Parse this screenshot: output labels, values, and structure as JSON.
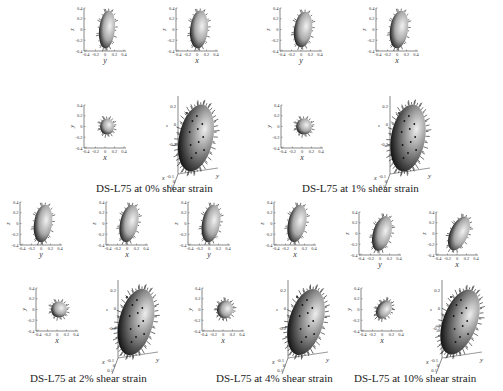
{
  "figure": {
    "groups": [
      {
        "caption": "DS-L75 at 0% shear strain",
        "strain": "0%"
      },
      {
        "caption": "DS-L75 at 1% shear strain",
        "strain": "1%"
      },
      {
        "caption": "DS-L75 at 2% shear strain",
        "strain": "2%"
      },
      {
        "caption": "DS-L75 at 4% shear strain",
        "strain": "4%"
      },
      {
        "caption": "DS-L75 at 10% shear strain",
        "strain": "10%"
      }
    ],
    "subplot_types": [
      {
        "view": "z-vs-y",
        "xlabel": "y",
        "ylabel": "z"
      },
      {
        "view": "z-vs-x",
        "xlabel": "x",
        "ylabel": "z"
      },
      {
        "view": "y-vs-x",
        "xlabel": "x",
        "ylabel": "y"
      },
      {
        "view": "3d",
        "xlabel": "x",
        "ylabel": "y",
        "zlabel": "z"
      }
    ],
    "axis_ticks": [
      "-0.4",
      "-0.2",
      "0",
      "0.2",
      "0.4"
    ],
    "ticks_3d_z": [
      "0.2",
      "0",
      "-0.2"
    ],
    "ticks_3d_x": [
      "-0.1",
      "0",
      "0.1"
    ]
  }
}
